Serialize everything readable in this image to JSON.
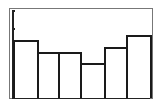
{
  "chart_data": {
    "type": "bar",
    "title": "",
    "xlabel": "",
    "ylabel": "",
    "categories": [
      "1",
      "2",
      "3",
      "4",
      "5",
      "6"
    ],
    "values": [
      3.3,
      2.6,
      2.6,
      2.0,
      2.9,
      3.6
    ],
    "ylim": [
      0,
      5
    ],
    "yticks": [
      1,
      2,
      3,
      4,
      5
    ],
    "tick_labels_visible": false,
    "grid": false,
    "legend": null,
    "bar_fill": "#ffffff",
    "bar_edge": "#1a1a1a"
  }
}
